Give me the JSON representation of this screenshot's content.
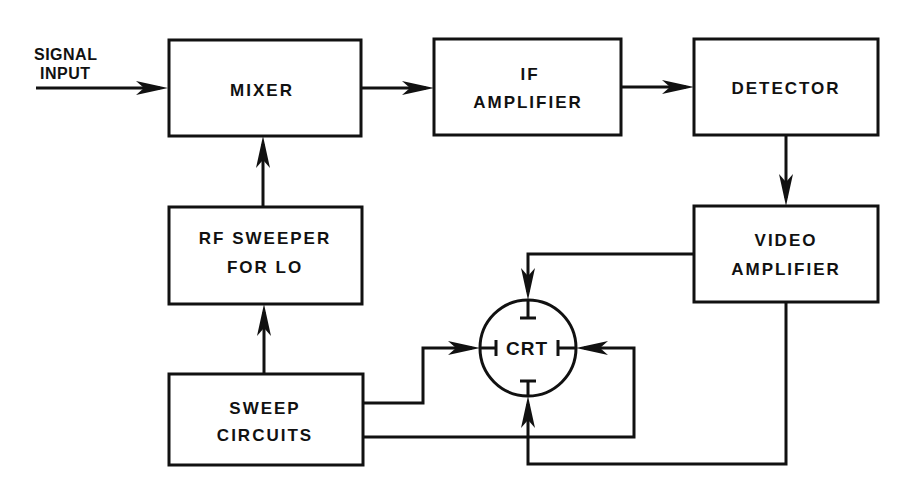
{
  "diagram": {
    "input_label": [
      "SIGNAL",
      "INPUT"
    ],
    "blocks": {
      "mixer": [
        "MIXER"
      ],
      "if_amplifier": [
        "IF",
        "AMPLIFIER"
      ],
      "detector": [
        "DETECTOR"
      ],
      "video_amplifier": [
        "VIDEO",
        "AMPLIFIER"
      ],
      "rf_sweeper": [
        "RF SWEEPER",
        "FOR LO"
      ],
      "sweep_circuits": [
        "SWEEP",
        "CIRCUITS"
      ],
      "crt": [
        "CRT"
      ]
    },
    "connections": [
      {
        "from": "signal-input",
        "to": "mixer"
      },
      {
        "from": "mixer",
        "to": "if_amplifier"
      },
      {
        "from": "if_amplifier",
        "to": "detector"
      },
      {
        "from": "detector",
        "to": "video_amplifier"
      },
      {
        "from": "video_amplifier",
        "to": "crt",
        "port": "top-plate"
      },
      {
        "from": "video_amplifier",
        "to": "crt",
        "port": "bottom-plate"
      },
      {
        "from": "rf_sweeper",
        "to": "mixer"
      },
      {
        "from": "sweep_circuits",
        "to": "rf_sweeper"
      },
      {
        "from": "sweep_circuits",
        "to": "crt",
        "port": "left-plate"
      },
      {
        "from": "sweep_circuits",
        "to": "crt",
        "port": "right-plate"
      }
    ],
    "colors": {
      "ink": "#111111",
      "background": "#ffffff"
    }
  }
}
